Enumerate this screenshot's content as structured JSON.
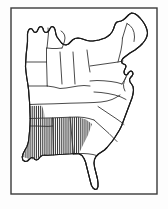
{
  "figure": {
    "kind": "line-map",
    "caption": "",
    "width": 168,
    "height": 209,
    "background_color": "#fdfdfd"
  },
  "frame": {
    "name": "map-border",
    "x": 11,
    "y": 8,
    "width": 146,
    "height": 186,
    "stroke_color": "#3a3a3a",
    "stroke_width": 1.4,
    "fill_color": "#ffffff"
  },
  "style": {
    "coastline_color": "#1a1a1a",
    "coastline_width": 1.15,
    "state_border_color": "#2b2b2b",
    "state_border_width": 0.85,
    "land_fill": "#ffffff",
    "hatch_color": "#1c1c1c",
    "hatch_line_width": 0.9,
    "hatch_spacing": 1.9,
    "hatch_angle_deg": 90
  },
  "legend": {
    "shown": false,
    "hatch_meaning": "highlighted region"
  },
  "regions": [
    {
      "name": "deep-south-hatched-region",
      "label": "Deep South",
      "pattern": "vertical-hatch",
      "states": [
        "Louisiana",
        "Mississippi",
        "Alabama",
        "Georgia"
      ],
      "highlighted": true
    },
    {
      "name": "unhatched-region",
      "label": "Remaining Eastern States",
      "pattern": "none",
      "highlighted": false
    }
  ],
  "outline_paths": {
    "coastline": "M 27.5 41.5 L 27.0 47.0 L 26.2 54.0 L 25.8 60.5 L 25.5 66.5 L 26.0 72.0 L 26.8 78.0 L 27.8 84.0 L 28.6 90.0 L 29.0 96.0 L 29.5 101.5 L 29.8 107.0 L 30.0 113.0 L 30.2 119.0 L 30.0 125.0 L 29.6 131.0 L 29.0 137.0 L 28.4 142.0 L 27.0 146.5 L 25.0 150.0 L 23.2 153.5 L 22.2 157.0 L 22.8 160.0 L 25.0 161.5 L 27.5 161.0 L 29.5 159.0 L 31.5 157.5 L 33.5 157.8 L 35.0 159.5 L 36.5 160.0 L 38.5 159.0 L 40.0 157.0 L 42.0 155.5 L 44.5 155.0 L 47.5 155.2 L 51.0 155.0 L 55.0 154.8 L 59.0 154.5 L 63.0 154.3 L 67.0 154.0 L 71.0 153.8 L 75.0 153.5 L 79.0 153.8 L 82.0 155.5 L 84.0 158.5 L 85.5 162.0 L 86.5 166.0 L 87.5 170.0 L 88.5 174.0 L 89.5 178.0 L 90.5 182.0 L 91.5 185.5 L 93.0 188.0 L 95.0 189.5 L 97.0 189.0 L 98.0 186.5 L 98.0 183.0 L 97.5 179.0 L 96.5 175.0 L 95.5 171.0 L 94.5 167.0 L 94.0 163.0 L 94.5 159.5 L 96.0 156.5 L 98.5 154.0 L 101.5 152.0 L 104.5 150.0 L 107.0 147.5 L 109.5 144.5 L 112.0 141.5 L 114.5 138.0 L 117.0 134.0 L 119.5 130.0 L 121.5 126.0 L 123.0 122.0 L 124.5 118.0 L 126.0 114.0 L 127.5 110.0 L 129.0 106.0 L 130.5 102.0 L 132.0 98.0 L 133.0 94.0 L 133.5 90.0 L 133.0 86.5 L 131.5 84.0 L 130.0 82.0 L 129.5 79.5 L 130.5 77.5 L 132.0 76.0 L 133.0 74.0 L 132.5 72.0 L 131.0 71.0 L 129.5 71.5 L 128.5 73.0 L 127.5 74.5 L 126.0 75.0 L 124.5 74.0 L 124.0 72.0 L 124.5 70.0 L 125.5 68.0 L 126.0 66.0 L 125.0 64.5 L 123.5 64.0 L 122.0 63.0 L 121.5 61.0 L 122.5 59.0 L 124.0 57.5 L 126.0 56.0 L 128.0 54.5 L 130.0 53.0 L 132.5 51.5 L 135.0 50.0 L 137.5 48.0 L 140.0 46.0 L 142.5 43.5 L 144.5 41.0 L 146.0 38.5 L 147.0 36.0 L 147.5 33.0 L 147.0 30.0 L 146.0 27.0 L 144.5 24.0 L 142.5 21.0 L 140.0 18.0 L 137.5 15.5 L 134.5 13.5 L 131.5 13.0 L 129.0 14.5 L 127.0 16.5 L 125.0 18.5 L 123.0 20.0 L 121.0 21.0 L 119.0 21.5 L 117.0 22.0 L 115.5 23.5 L 114.5 26.0 L 113.5 29.0 L 112.0 32.0 L 110.0 34.5 L 107.5 36.5 L 105.0 38.0 L 102.0 39.0 L 99.0 40.0 L 96.0 40.5 L 93.0 41.0 L 90.0 41.0 L 87.0 40.5 L 84.0 39.5 L 81.0 38.5 L 78.0 38.0 L 75.0 38.5 L 72.5 40.0 L 70.5 42.0 L 68.5 44.0 L 66.0 45.0 L 63.5 44.5 L 61.5 43.0 L 60.0 41.0 L 58.5 39.0 L 57.0 37.0 L 56.0 34.5 L 55.5 32.0 L 55.0 29.5 L 54.0 27.5 L 52.5 26.5 L 51.0 27.0 L 50.0 28.5 L 49.0 30.5 L 47.5 32.0 L 46.0 32.5 L 44.5 32.0 L 43.5 30.5 L 43.0 28.5 L 42.0 27.0 L 40.5 26.5 L 39.0 27.5 L 38.0 29.5 L 37.0 31.5 L 35.5 32.5 L 34.0 32.0 L 33.0 30.5 L 32.0 29.0 L 30.5 28.5 L 29.0 29.5 L 28.0 31.5 L 27.5 34.0 L 27.5 37.5 Z"
  },
  "state_divisions": [
    {
      "name": "minnesota-wisconsin-line",
      "d": "M 48.0 28.0 L 48.5 33.0 L 48.0 38.0 L 47.5 43.0 L 47.0 48.0"
    },
    {
      "name": "wisconsin-michigan-line",
      "d": "M 47.0 48.0 L 52.0 48.5 L 57.0 48.5 L 62.0 48.0"
    },
    {
      "name": "lake-michigan-shore",
      "d": "M 62.0 48.0 L 63.5 44.5 L 64.5 41.0 L 65.0 38.0 L 64.5 35.0 L 63.0 32.5 L 61.0 31.0"
    },
    {
      "name": "iowa-missouri-line",
      "d": "M 26.5 62.0 L 33.0 62.0 L 40.0 62.0 L 46.5 62.0"
    },
    {
      "name": "illinois-west-line",
      "d": "M 46.5 48.0 L 46.5 55.0 L 46.5 62.0 L 46.8 70.0 L 47.0 78.0 L 47.2 86.0"
    },
    {
      "name": "illinois-indiana-line",
      "d": "M 60.0 52.0 L 60.5 60.0 L 61.0 68.0 L 61.5 76.0 L 62.0 84.0"
    },
    {
      "name": "indiana-ohio-line",
      "d": "M 73.0 52.0 L 73.5 60.0 L 74.0 68.0 L 74.5 76.0 L 75.0 84.0"
    },
    {
      "name": "ohio-pennsylvania-line",
      "d": "M 87.0 50.0 L 88.0 58.0 L 89.0 66.0 L 90.0 72.0"
    },
    {
      "name": "missouri-arkansas-line",
      "d": "M 28.5 86.0 L 36.0 86.0 L 43.0 86.0 L 47.2 86.0"
    },
    {
      "name": "ohio-river-line",
      "d": "M 47.2 86.0 L 54.0 87.0 L 60.0 88.5 L 66.0 88.0 L 72.0 87.0 L 78.0 86.0 L 84.0 85.5 L 90.0 86.0"
    },
    {
      "name": "kentucky-tennessee-line",
      "d": "M 29.6 104.5 L 38.0 104.2 L 46.0 104.0 L 54.0 103.8 L 62.0 103.5 L 70.0 103.2 L 78.0 103.0 L 86.0 102.8 L 94.0 102.5 L 101.0 102.0 L 107.0 101.0 L 112.0 99.5 L 116.0 97.5 L 120.0 95.0"
    },
    {
      "name": "tennessee-south-line",
      "d": "M 30.0 118.5 L 38.0 118.3 L 46.0 118.0 L 54.0 117.8 L 62.0 117.5 L 70.0 117.2 L 78.0 117.0 L 84.0 117.5 L 89.0 118.5 L 94.0 120.0"
    },
    {
      "name": "mississippi-alabama-line",
      "d": "M 52.5 118.0 L 52.8 126.0 L 53.0 134.0 L 53.2 142.0 L 53.4 150.0 L 53.5 155.0"
    },
    {
      "name": "alabama-georgia-line",
      "d": "M 70.0 117.2 L 70.8 125.0 L 71.5 133.0 L 72.2 141.0 L 73.0 149.0 L 73.5 154.0"
    },
    {
      "name": "louisiana-mississippi-line",
      "d": "M 30.2 126.0 L 36.0 126.0 L 42.0 126.2 L 48.0 126.4 L 52.8 126.0"
    },
    {
      "name": "florida-georgia-line",
      "d": "M 73.5 154.0 L 78.0 153.7 L 83.0 153.5 L 88.0 153.8 L 93.0 154.5 L 96.5 155.5"
    },
    {
      "name": "georgia-southcarolina-line",
      "d": "M 94.0 120.0 L 99.0 124.5 L 104.0 129.0 L 109.0 133.5 L 113.5 138.0 L 117.0 141.5"
    },
    {
      "name": "southcarolina-northcarolina-line",
      "d": "M 98.0 106.5 L 104.0 110.5 L 110.0 114.5 L 116.0 118.5 L 121.0 122.0 L 124.0 124.5"
    },
    {
      "name": "northcarolina-virginia-line",
      "d": "M 94.0 92.0 L 101.0 92.5 L 108.0 93.5 L 115.0 95.0 L 121.0 97.0 L 126.0 99.5"
    },
    {
      "name": "virginia-maryland-line",
      "d": "M 90.0 81.0 L 97.0 80.5 L 104.0 80.8 L 111.0 81.5 L 117.0 82.5 L 122.0 84.0"
    },
    {
      "name": "pennsylvania-newyork-line",
      "d": "M 90.0 66.0 L 97.0 65.0 L 104.0 64.0 L 111.0 63.0 L 118.0 62.0 L 123.0 61.0"
    },
    {
      "name": "newyork-newengland-line",
      "d": "M 118.0 62.0 L 119.5 56.0 L 121.0 50.0 L 122.0 44.0 L 122.5 38.0"
    },
    {
      "name": "vermont-newhampshire-line",
      "d": "M 122.5 38.0 L 124.0 33.0 L 125.5 28.0 L 127.0 23.5"
    },
    {
      "name": "newhampshire-maine-line",
      "d": "M 127.0 23.5 L 130.0 25.5 L 132.5 28.5 L 134.0 32.5 L 134.5 37.0 L 134.0 41.5"
    },
    {
      "name": "maryland-delaware-neck",
      "d": "M 122.0 84.0 L 124.5 80.0 L 126.5 76.0 L 128.0 72.5"
    },
    {
      "name": "chesapeake-bay-inlet",
      "d": "M 126.0 77.0 L 124.5 80.5 L 123.5 84.5 L 123.8 88.0 L 125.0 91.0"
    }
  ],
  "hatch_polygons": [
    {
      "name": "mississippi-alabama-hatch",
      "points": "30.0 118.5, 52.5 118.0, 70.0 117.2, 72.0 133.0, 73.0 149.0, 73.4 154.0, 55.0 154.8, 44.5 155.0, 40.0 157.0, 35.0 159.5, 29.5 159.0, 23.0 157.0, 26.0 149.0, 29.0 137.0, 30.2 126.0"
    },
    {
      "name": "northern-mississippi-strip",
      "points": "30.0 106.0, 42.0 105.8, 44.0 112.0, 44.5 118.2, 30.0 118.5"
    },
    {
      "name": "west-georgia-hatch",
      "points": "70.0 117.2, 78.0 117.0, 86.0 119.5, 92.0 124.0, 88.0 135.0, 83.0 145.0, 79.0 153.6, 73.4 154.0, 72.2 141.0, 70.8 125.0"
    }
  ]
}
